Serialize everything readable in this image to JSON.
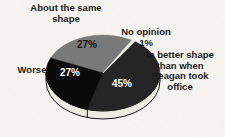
{
  "chart_data": {
    "type": "pie",
    "style": "3d",
    "start_angle_deg": 56,
    "direction": "counterclockwise",
    "slices": [
      {
        "label": "No opinion",
        "value": 1,
        "pct_label": "1%",
        "color": "#f4f3ed",
        "pct_label_color": "#1b1b1b",
        "pct_label_position": "outside"
      },
      {
        "label": "About the same shape",
        "value": 27,
        "pct_label": "27%",
        "color": "#7d7d7d",
        "pct_label_color": "#141414",
        "pct_label_position": "inside"
      },
      {
        "label": "Worse",
        "value": 27,
        "pct_label": "27%",
        "color": "#0b0b0b",
        "pct_label_color": "#ffffff",
        "pct_label_position": "inside"
      },
      {
        "label": "In better shape than when Reagan took office",
        "value": 45,
        "pct_label": "45%",
        "color": "#272727",
        "pct_label_color": "#ffffff",
        "pct_label_position": "inside"
      }
    ],
    "rim_color": "#f2f1ea",
    "outline_color": "#161616",
    "background": "#fbfaf7",
    "legend": "none",
    "labels_style": "outside text callouts, no leader lines"
  },
  "annotations": {
    "same_shape": "About the same\nshape",
    "no_opinion": "No opinion\n1%",
    "worse": "Worse",
    "better_shape": "In better shape\nthan when\nReagan took\noffice"
  }
}
